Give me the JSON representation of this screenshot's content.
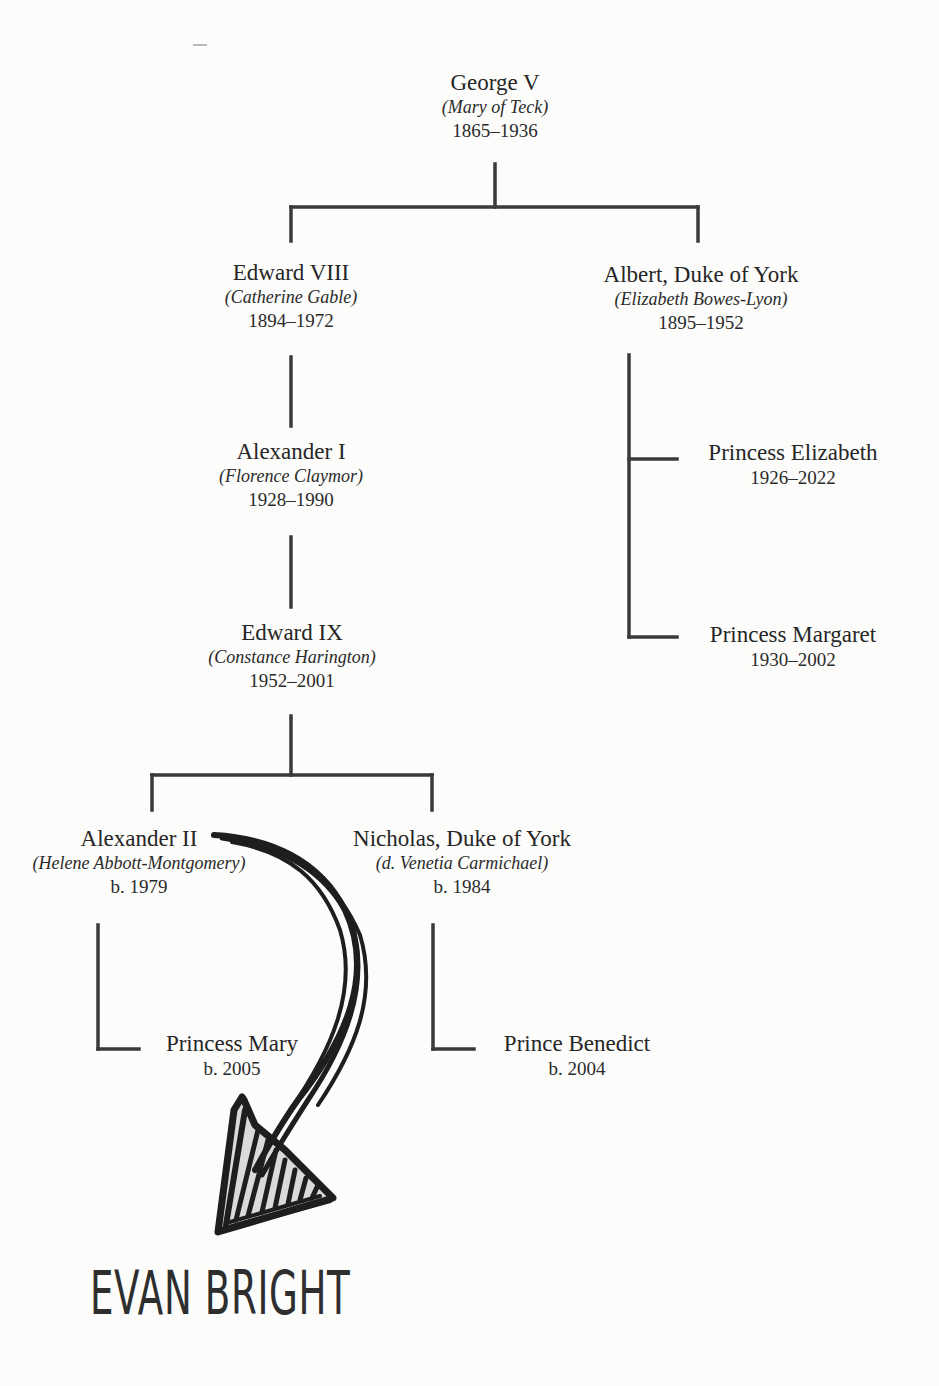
{
  "family_tree": {
    "generation_1": {
      "root": {
        "name": "George V",
        "spouse": "(Mary of Teck)",
        "dates": "1865–1936"
      }
    },
    "generation_2": [
      {
        "name": "Edward VIII",
        "spouse": "(Catherine Gable)",
        "dates": "1894–1972"
      },
      {
        "name": "Albert, Duke of York",
        "spouse": "(Elizabeth Bowes-Lyon)",
        "dates": "1895–1952",
        "children": [
          {
            "name": "Princess Elizabeth",
            "dates": "1926–2022"
          },
          {
            "name": "Princess Margaret",
            "dates": "1930–2002"
          }
        ]
      }
    ],
    "generation_3": {
      "name": "Alexander I",
      "spouse": "(Florence Claymor)",
      "dates": "1928–1990"
    },
    "generation_4": {
      "name": "Edward IX",
      "spouse": "(Constance Harington)",
      "dates": "1952–2001"
    },
    "generation_5": [
      {
        "name": "Alexander II",
        "spouse": "(Helene Abbott-Montgomery)",
        "dates": "b. 1979",
        "children": [
          {
            "name": "Princess Mary",
            "dates": "b. 2005"
          }
        ]
      },
      {
        "name": "Nicholas, Duke of York",
        "spouse": "(d. Venetia Carmichael)",
        "dates": "b. 1984",
        "children": [
          {
            "name": "Prince Benedict",
            "dates": "b. 2004"
          }
        ]
      }
    ]
  },
  "annotation": {
    "arrow_icon": "hand-drawn-arrow-icon",
    "label": "EVAN BRIGHT"
  },
  "colors": {
    "line": "#3a3a3a",
    "text": "#262626",
    "background": "#fcfcfb",
    "ink": "#1e1e1e"
  }
}
